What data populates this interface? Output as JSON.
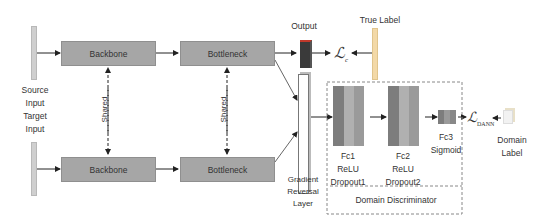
{
  "diagram": {
    "source_input": [
      "Source",
      "Input"
    ],
    "target_input": [
      "Target",
      "Input"
    ],
    "backbone_label": "Backbone",
    "bottleneck_label": "Bottleneck",
    "shared_label": "Shared",
    "output_label": "Output",
    "true_label": "True Label",
    "loss_c": "ℒ",
    "loss_c_sub": "c",
    "grl": [
      "Gradient",
      "Reversal",
      "Layer"
    ],
    "fc1": [
      "Fc1",
      "ReLU",
      "Dropout1"
    ],
    "fc2": [
      "Fc2",
      "ReLU",
      "Dropout2"
    ],
    "fc3": [
      "Fc3",
      "Sigmoid"
    ],
    "loss_dann": "ℒ",
    "loss_dann_sub": "DANN",
    "domain_label": [
      "Domain",
      "Label"
    ],
    "domain_discriminator": "Domain Discriminator",
    "colors": {
      "box": "#a6a6a6",
      "output": "#3a3a3a",
      "fc_dark": "#7d7d7d",
      "fc_mid": "#b0b0b0",
      "fc_light": "#9a9a9a"
    }
  }
}
